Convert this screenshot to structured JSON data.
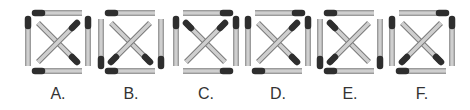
{
  "colors": {
    "match_body": "#cfcfcf",
    "match_outline": "#7a7a7a",
    "match_head": "#2e2e2e",
    "label": "#333333"
  },
  "figures": [
    {
      "label": "A.",
      "x": 22,
      "heads": {
        "top": "left",
        "bottom": "left",
        "left": "top",
        "right": "top",
        "diag_tl_br": "br",
        "diag_tr_bl": "tr"
      }
    },
    {
      "label": "B.",
      "x": 95,
      "heads": {
        "top": "left",
        "bottom": "left",
        "left": "bottom",
        "right": "bottom",
        "diag_tl_br": "br",
        "diag_tr_bl": "bl"
      }
    },
    {
      "label": "C.",
      "x": 170,
      "heads": {
        "top": "right",
        "bottom": "right",
        "left": "top",
        "right": "top",
        "diag_tl_br": "tl",
        "diag_tr_bl": "tr"
      }
    },
    {
      "label": "D.",
      "x": 242,
      "heads": {
        "top": "right",
        "bottom": "left",
        "left": "top",
        "right": "top",
        "diag_tl_br": "br",
        "diag_tr_bl": "tr"
      }
    },
    {
      "label": "E.",
      "x": 314,
      "heads": {
        "top": "left",
        "bottom": "left",
        "left": "bottom",
        "right": "bottom",
        "diag_tl_br": "tl",
        "diag_tr_bl": "bl"
      }
    },
    {
      "label": "F.",
      "x": 386,
      "heads": {
        "top": "right",
        "bottom": "left",
        "left": "top",
        "right": "top",
        "diag_tl_br": "br",
        "diag_tr_bl": "bl"
      }
    }
  ]
}
